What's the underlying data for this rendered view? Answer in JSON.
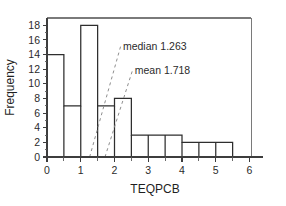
{
  "chart_data": {
    "type": "bar",
    "title": "",
    "subtitle": "",
    "xlabel": "TEQPCB",
    "ylabel": "Frequency",
    "xlim": [
      0,
      6.4
    ],
    "ylim": [
      0,
      19
    ],
    "grid": false,
    "legend": "none",
    "bin_width": 0.5,
    "bin_edges": [
      0,
      0.5,
      1,
      1.5,
      2,
      2.5,
      3,
      3.5,
      4,
      4.5,
      5,
      5.5
    ],
    "categories": [
      "0-0.5",
      "0.5-1",
      "1-1.5",
      "1.5-2",
      "2-2.5",
      "2.5-3",
      "3-3.5",
      "3.5-4",
      "4-4.5",
      "4.5-5",
      "5-5.5"
    ],
    "values": [
      14,
      7,
      18,
      7,
      8,
      3,
      3,
      3,
      2,
      2,
      2
    ],
    "x_ticks": [
      0,
      1,
      2,
      3,
      4,
      5,
      6
    ],
    "x_tick_labels": [
      "0",
      "1",
      "2",
      "3",
      "4",
      "5",
      "6"
    ],
    "x_minor_ticks": [
      0.5,
      1.5,
      2.5,
      3.5,
      4.5,
      5.5
    ],
    "y_ticks": [
      0,
      2,
      4,
      6,
      8,
      10,
      12,
      14,
      16,
      18
    ],
    "y_tick_labels": [
      "0",
      "2",
      "4",
      "6",
      "8",
      "10",
      "12",
      "14",
      "16",
      "18"
    ],
    "annotations": [
      {
        "id": "median",
        "label": "median 1.263",
        "value": 1.263,
        "text_x": 2.25,
        "text_y": 14.6,
        "leader_from_x": 1.263,
        "leader_from_y": 0,
        "leader_to_x": 2.18,
        "leader_to_y": 15.1
      },
      {
        "id": "mean",
        "label": "mean 1.718",
        "value": 1.718,
        "text_x": 2.6,
        "text_y": 11.3,
        "leader_from_x": 1.718,
        "leader_from_y": 0,
        "leader_to_x": 2.53,
        "leader_to_y": 11.8
      }
    ],
    "colors": {
      "bar_stroke": "#2e2e2e",
      "bar_fill": "none",
      "axis": "#3d3d3d",
      "frame": "#7a7a7a",
      "leader": "#8e8e8e",
      "text": "#2b2b2b",
      "background": "#ffffff"
    }
  }
}
